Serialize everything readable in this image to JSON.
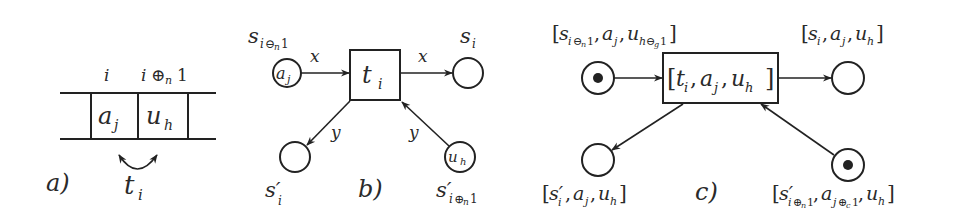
{
  "figure": {
    "panels": [
      {
        "id": "a",
        "caption": "a)",
        "description": "Tape cells with symbols swapped by transition",
        "position_labels": [
          "i",
          "i ⊕n 1"
        ],
        "cells": [
          {
            "symbol": "a",
            "sub": "j"
          },
          {
            "symbol": "u",
            "sub": "h"
          }
        ],
        "transition": {
          "symbol": "t",
          "sub": "i"
        }
      },
      {
        "id": "b",
        "caption": "b)",
        "description": "Petri net fragment for transition t_i",
        "transition": {
          "symbol": "t",
          "sub": "i"
        },
        "places": [
          {
            "id": "s_in",
            "label": "s",
            "sub": "i⊖n1",
            "token": "aj",
            "token_symbol": "a",
            "token_sub": "j"
          },
          {
            "id": "s_out",
            "label": "s",
            "sub": "i",
            "token": ""
          },
          {
            "id": "sp_out",
            "label": "s′",
            "sub": "i",
            "token": ""
          },
          {
            "id": "sp_in",
            "label": "s′",
            "sub": "i⊕n1",
            "token": "uh",
            "token_symbol": "u",
            "token_sub": "h"
          }
        ],
        "arc_labels": {
          "top_left": "x",
          "top_right": "x",
          "bottom_left": "y",
          "bottom_right": "y"
        }
      },
      {
        "id": "c",
        "caption": "c)",
        "description": "Unfolded (colored-to-elementary) net",
        "transition_label": {
          "open": "[",
          "parts": [
            {
              "s": "t",
              "sub": "i"
            },
            {
              "s": "a",
              "sub": "j"
            },
            {
              "s": "u",
              "sub": "h"
            }
          ],
          "close": "]"
        },
        "places": [
          {
            "id": "c_in",
            "label_parts": [
              {
                "s": "s",
                "sub": "i⊖n1"
              },
              {
                "s": "a",
                "sub": "j"
              },
              {
                "s": "u",
                "sub": "h⊖g1"
              }
            ],
            "marked": true
          },
          {
            "id": "c_out",
            "label_parts": [
              {
                "s": "s",
                "sub": "i"
              },
              {
                "s": "a",
                "sub": "j"
              },
              {
                "s": "u",
                "sub": "h"
              }
            ],
            "marked": false
          },
          {
            "id": "c_pout",
            "label_parts": [
              {
                "s": "s′",
                "sub": "i"
              },
              {
                "s": "a",
                "sub": "j"
              },
              {
                "s": "u",
                "sub": "h"
              }
            ],
            "marked": false
          },
          {
            "id": "c_pin",
            "label_parts": [
              {
                "s": "s′",
                "sub": "i⊕n1"
              },
              {
                "s": "a",
                "sub": "j⊕c1"
              },
              {
                "s": "u",
                "sub": "h"
              }
            ],
            "marked": true
          }
        ]
      }
    ],
    "colors": {
      "stroke": "#222222",
      "text": "#2a2a2a",
      "background": "#ffffff"
    }
  }
}
